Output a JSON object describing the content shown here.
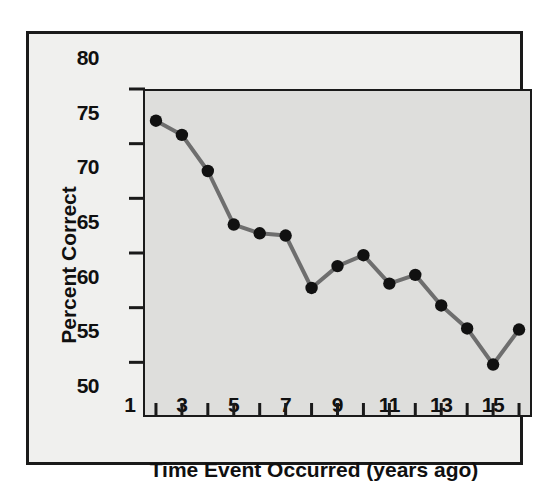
{
  "chart_data": {
    "type": "line",
    "title": "",
    "xlabel": "Time Event Occurred (years ago)",
    "ylabel": "Percent Correct",
    "x": [
      1,
      2,
      3,
      4,
      5,
      6,
      7,
      8,
      9,
      10,
      11,
      12,
      13,
      14,
      15
    ],
    "values": [
      77.1,
      75.8,
      72.5,
      67.6,
      66.8,
      66.6,
      61.8,
      63.8,
      64.8,
      62.2,
      63.0,
      60.2,
      58.1,
      54.8,
      58.0
    ],
    "series": [
      {
        "name": "Percent Correct",
        "values": [
          77.1,
          75.8,
          72.5,
          67.6,
          66.8,
          66.6,
          61.8,
          63.8,
          64.8,
          62.2,
          63.0,
          60.2,
          58.1,
          54.8,
          58.0
        ]
      }
    ],
    "xlim": [
      0.5,
      15.5
    ],
    "ylim": [
      50,
      80
    ],
    "ytick_labels": [
      "50",
      "55",
      "60",
      "65",
      "70",
      "75",
      "80"
    ],
    "ytick_values": [
      50,
      55,
      60,
      65,
      70,
      75,
      80
    ],
    "xtick_values": [
      1,
      2,
      3,
      4,
      5,
      6,
      7,
      8,
      9,
      10,
      11,
      12,
      13,
      14,
      15
    ],
    "xtick_labels": [
      "1",
      "",
      "3",
      "",
      "5",
      "",
      "7",
      "",
      "9",
      "",
      "11",
      "",
      "13",
      "",
      "15"
    ],
    "grid": false,
    "legend": "none",
    "line_color": "#6e6e6e",
    "marker_color": "#111111",
    "plot_background": "#dededc",
    "figure_background": "#f0f0ee",
    "axis_color": "#1a1a1a"
  }
}
